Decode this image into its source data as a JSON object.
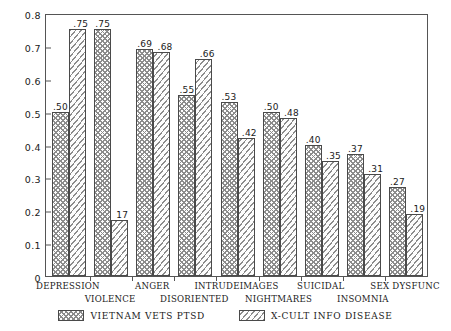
{
  "chart_data": {
    "type": "bar",
    "title": "",
    "subtitle": "",
    "xlabel": "",
    "ylabel": "",
    "ylim": [
      0,
      0.8
    ],
    "ytick_labels": [
      "0.8",
      "0.7",
      "0.6",
      "0.5",
      "0.4",
      "0.3",
      "0.2",
      "0.1",
      "0"
    ],
    "ytick_values": [
      0.8,
      0.7,
      0.6,
      0.5,
      0.4,
      0.3,
      0.2,
      0.1,
      0
    ],
    "grid": false,
    "legend_position": "bottom-center",
    "categories": [
      "DEPRESSION",
      "VIOLENCE",
      "ANGER",
      "DISORIENTED",
      "INTRUDEIMAGES",
      "NIGHTMARES",
      "SUICIDAL",
      "INSOMNIA",
      "SEX DYSFUNC"
    ],
    "series": [
      {
        "name": "VIETNAM VETS PTSD",
        "pattern": "cross-hatch",
        "values": [
          0.5,
          0.75,
          0.69,
          0.55,
          0.53,
          0.5,
          0.4,
          0.37,
          0.27
        ],
        "labels": [
          ".50",
          ".75",
          ".69",
          ".55",
          ".53",
          ".50",
          ".40",
          ".37",
          ".27"
        ]
      },
      {
        "name": "X-CULT INFO DISEASE",
        "pattern": "diagonal-stripe",
        "values": [
          0.75,
          0.17,
          0.68,
          0.66,
          0.42,
          0.48,
          0.35,
          0.31,
          0.19
        ],
        "labels": [
          ".75",
          "17",
          ".68",
          ".66",
          ".42",
          ".48",
          ".35",
          ".31",
          ".19"
        ]
      }
    ]
  },
  "legend": {
    "items": [
      {
        "label": "VIETNAM VETS PTSD",
        "pattern": "cross-hatch"
      },
      {
        "label": "X-CULT INFO DISEASE",
        "pattern": "diagonal-stripe"
      }
    ]
  },
  "colors": {
    "axis": "#555555",
    "bar_outline": "#4a4a4a",
    "hatch": "#8c8c8c",
    "background": "#ffffff",
    "text": "#1a1a1a"
  }
}
